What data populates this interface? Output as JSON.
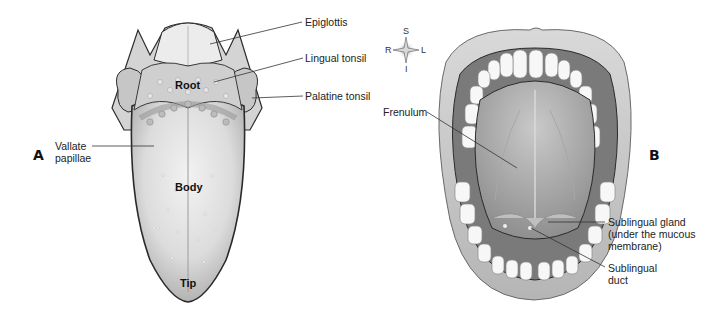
{
  "figure": {
    "panels": [
      {
        "letter": "A",
        "subject": "tongue-dorsal-surface",
        "regions": {
          "root": "Root",
          "body": "Body",
          "tip": "Tip"
        },
        "labels": {
          "epiglottis": "Epiglottis",
          "lingual_tonsil": "Lingual tonsil",
          "palatine_tonsil": "Palatine tonsil",
          "vallate_papillae_line1": "Vallate",
          "vallate_papillae_line2": "papillae"
        }
      },
      {
        "letter": "B",
        "subject": "mouth-floor-underside-of-tongue",
        "labels": {
          "frenulum": "Frenulum",
          "sublingual_gland_line1": "Sublingual gland",
          "sublingual_gland_line2": "(under the mucous",
          "sublingual_gland_line3": "membrane)",
          "sublingual_duct_line1": "Sublingual",
          "sublingual_duct_line2": "duct"
        }
      }
    ],
    "compass": {
      "superior": "S",
      "inferior": "I",
      "right": "R",
      "left": "L"
    },
    "colors": {
      "outline": "#2a2a2a",
      "tissue_light": "#e6e6e6",
      "tissue_mid": "#bdbdbd",
      "tissue_dark": "#8a8a8a",
      "teeth": "#f7f7f7",
      "leader_line": "#333333"
    }
  }
}
